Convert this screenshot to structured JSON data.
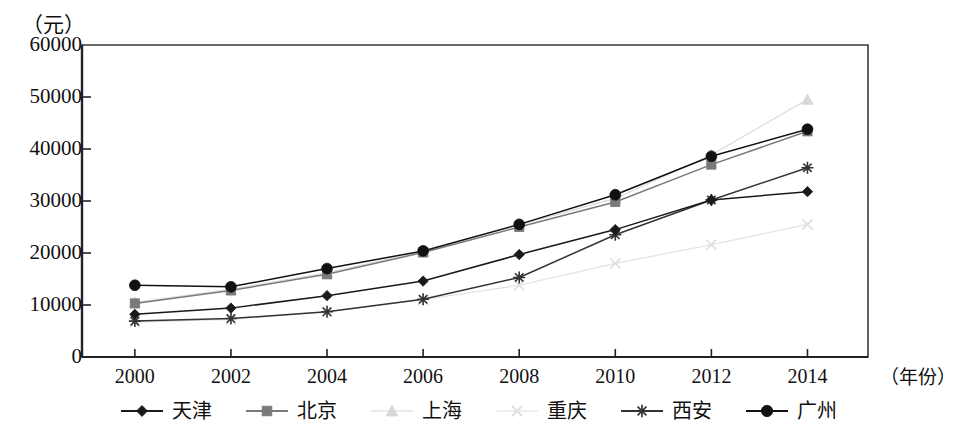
{
  "chart_data": {
    "type": "line",
    "title": "",
    "subtitle": "",
    "xlabel": "（年份）",
    "ylabel": "（元）",
    "categories": [
      "2000",
      "2002",
      "2004",
      "2006",
      "2008",
      "2010",
      "2012",
      "2014"
    ],
    "x": [
      2000,
      2002,
      2004,
      2006,
      2008,
      2010,
      2012,
      2014
    ],
    "xlim": [
      1999,
      2015
    ],
    "ylim": [
      0,
      60000
    ],
    "yticks": [
      0,
      10000,
      20000,
      30000,
      40000,
      50000,
      60000
    ],
    "ytick_labels": [
      "0",
      "10000",
      "20000",
      "30000",
      "40000",
      "50000",
      "60000"
    ],
    "grid": false,
    "legend_position": "bottom",
    "series": [
      {
        "name": "天津",
        "marker": "diamond",
        "color": "#1a1a1a",
        "values": [
          8200,
          9400,
          11800,
          14600,
          19700,
          24500,
          30200,
          31800
        ]
      },
      {
        "name": "北京",
        "marker": "square",
        "color": "#7a7a7a",
        "values": [
          10300,
          12800,
          15900,
          20100,
          25000,
          29800,
          37000,
          43400
        ]
      },
      {
        "name": "上海",
        "marker": "triangle",
        "color": "#d8d8d8",
        "values": [
          10500,
          13000,
          16200,
          20300,
          25400,
          30500,
          38900,
          49500
        ]
      },
      {
        "name": "重庆",
        "marker": "x",
        "color": "#e0e0e0",
        "values": [
          6700,
          7200,
          8700,
          11000,
          13800,
          18000,
          21600,
          25500
        ]
      },
      {
        "name": "西安",
        "marker": "asterisk",
        "color": "#333333",
        "values": [
          6900,
          7400,
          8700,
          11100,
          15300,
          23500,
          30200,
          36400
        ]
      },
      {
        "name": "广州",
        "marker": "circle",
        "color": "#111111",
        "values": [
          13800,
          13500,
          17000,
          20400,
          25500,
          31200,
          38600,
          43800
        ]
      }
    ]
  },
  "axes": {
    "y_unit": "（元）",
    "x_unit": "（年份）"
  },
  "legend": {
    "items": [
      {
        "label": "天津",
        "marker": "diamond-marker",
        "color": "#1a1a1a"
      },
      {
        "label": "北京",
        "marker": "square-marker",
        "color": "#7a7a7a"
      },
      {
        "label": "上海",
        "marker": "triangle-marker",
        "color": "#d8d8d8"
      },
      {
        "label": "重庆",
        "marker": "x-marker",
        "color": "#e0e0e0"
      },
      {
        "label": "西安",
        "marker": "asterisk-marker",
        "color": "#333333"
      },
      {
        "label": "广州",
        "marker": "circle-marker",
        "color": "#111111"
      }
    ]
  }
}
